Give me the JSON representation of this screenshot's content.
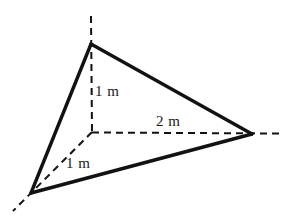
{
  "figure": {
    "type": "geometry-diagram",
    "background_color": "#ffffff",
    "stroke_color": "#121212",
    "solid_stroke_width": 3.2,
    "dashed_stroke_width": 2.0,
    "dash_pattern": "7 5"
  },
  "vertices": {
    "apex": {
      "x": 91,
      "y": 44
    },
    "bottom_left": {
      "x": 31,
      "y": 193
    },
    "right": {
      "x": 252,
      "y": 134
    },
    "origin": {
      "x": 92,
      "y": 132
    }
  },
  "solid_edges": [
    {
      "name": "edge-apex-to-right",
      "x1": 91,
      "y1": 44,
      "x2": 252,
      "y2": 134
    },
    {
      "name": "edge-apex-to-bottom-left",
      "x1": 91,
      "y1": 44,
      "x2": 31,
      "y2": 193
    },
    {
      "name": "edge-bottom-left-to-right",
      "x1": 31,
      "y1": 193,
      "x2": 252,
      "y2": 134
    }
  ],
  "dashed_lines": [
    {
      "name": "vertical-axis",
      "x1": 91,
      "y1": 16,
      "x2": 92,
      "y2": 132
    },
    {
      "name": "horizontal-axis",
      "x1": 92,
      "y1": 132,
      "x2": 281,
      "y2": 133
    },
    {
      "name": "diagonal-axis",
      "x1": 92,
      "y1": 132,
      "x2": 13,
      "y2": 211
    }
  ],
  "labels": {
    "height": "1 m",
    "base": "2 m",
    "depth": "1 m"
  }
}
